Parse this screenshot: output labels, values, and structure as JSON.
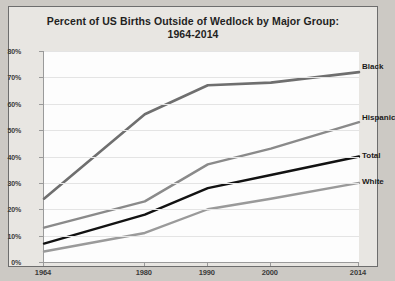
{
  "chart_data": {
    "type": "line",
    "title": "Percent of  US Births Outside of Wedlock by Major Group: 1964-2014",
    "title_line1": "Percent of  US Births Outside of Wedlock by Major Group:",
    "title_line2": "1964-2014",
    "xlabel": "",
    "ylabel": "",
    "categories": [
      "1964",
      "1980",
      "1990",
      "2000",
      "2014"
    ],
    "x": [
      1964,
      1980,
      1990,
      2000,
      2014
    ],
    "ylim": [
      0,
      80
    ],
    "yticks": [
      "0%",
      "10%",
      "20%",
      "30%",
      "40%",
      "50%",
      "60%",
      "70%",
      "80%"
    ],
    "ytick_values": [
      0,
      10,
      20,
      30,
      40,
      50,
      60,
      70,
      80
    ],
    "grid": true,
    "legend_position": "right-inline-labels",
    "series": [
      {
        "name": "Black",
        "label": "Black",
        "color": "#6f6f6f",
        "width": 2.6,
        "values": [
          24,
          56,
          67,
          68,
          72
        ]
      },
      {
        "name": "Hispanic",
        "label": "Hispanic",
        "color": "#8a8a8a",
        "width": 2.4,
        "values": [
          13,
          23,
          37,
          43,
          53
        ]
      },
      {
        "name": "Total",
        "label": "Total",
        "color": "#121212",
        "width": 2.4,
        "values": [
          7,
          18,
          28,
          33,
          40
        ]
      },
      {
        "name": "White",
        "label": "White",
        "color": "#9a9a9a",
        "width": 2.4,
        "values": [
          4,
          11,
          20,
          24,
          30
        ]
      }
    ]
  },
  "colors": {
    "page_background": "#ccc9c4",
    "chart_background": "#e8e6e2",
    "plot_background": "#fdfdfd",
    "axis": "#9a9a9a",
    "gridline": "#e4e4e4",
    "text": "#231f1e"
  }
}
